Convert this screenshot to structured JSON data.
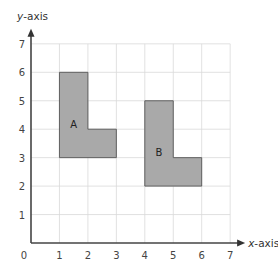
{
  "diagram": {
    "type": "coordinate-grid",
    "x_axis": {
      "label_var": "x",
      "label_rest": "-axis",
      "range": [
        0,
        7
      ],
      "ticks": [
        "0",
        "1",
        "2",
        "3",
        "4",
        "5",
        "6",
        "7"
      ]
    },
    "y_axis": {
      "label_var": "y",
      "label_rest": "-axis",
      "range": [
        0,
        7
      ],
      "ticks": [
        "1",
        "2",
        "3",
        "4",
        "5",
        "6",
        "7"
      ]
    },
    "grid": true,
    "colors": {
      "shape_fill": "#a9a9a9",
      "shape_stroke": "#555555",
      "grid": "#d9d9d9",
      "axis": "#444444"
    },
    "shapes": [
      {
        "name": "A",
        "vertices": [
          [
            1,
            3
          ],
          [
            1,
            6
          ],
          [
            2,
            6
          ],
          [
            2,
            4
          ],
          [
            3,
            4
          ],
          [
            3,
            3
          ]
        ],
        "label_at": [
          1.5,
          4.2
        ]
      },
      {
        "name": "B",
        "vertices": [
          [
            4,
            2
          ],
          [
            4,
            5
          ],
          [
            5,
            5
          ],
          [
            5,
            3
          ],
          [
            6,
            3
          ],
          [
            6,
            2
          ]
        ],
        "label_at": [
          4.5,
          3.2
        ]
      }
    ]
  }
}
